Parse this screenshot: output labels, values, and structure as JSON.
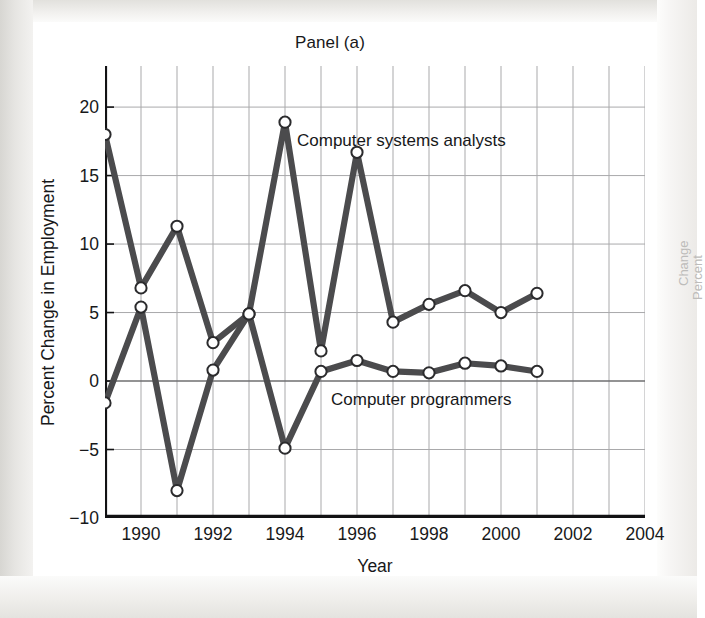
{
  "figure": {
    "title": "Panel (a)",
    "xlabel": "Year",
    "ylabel": "Percent Change in Employment"
  },
  "series_labels": {
    "analysts": "Computer systems analysts",
    "programmers": "Computer programmers"
  },
  "ghost": {
    "line1": "Percent",
    "line2": "Change"
  },
  "colors": {
    "line": "#4b4b4d",
    "marker_fill": "#ffffff",
    "marker_stroke": "#2b2b2d",
    "grid": "#a9a9ab",
    "axis": "#121214",
    "text": "#17181a"
  },
  "chart_data": {
    "type": "line",
    "title": "Panel (a)",
    "xlabel": "Year",
    "ylabel": "Percent Change in Employment",
    "xlim": [
      1989,
      2004
    ],
    "ylim": [
      -10,
      23
    ],
    "ytick_labels": [
      "20",
      "15",
      "10",
      "5",
      "0",
      "-5",
      "-10"
    ],
    "yticks": [
      20,
      15,
      10,
      5,
      0,
      -5,
      -10
    ],
    "xtick_labels": [
      "1990",
      "1992",
      "1994",
      "1996",
      "1998",
      "2000",
      "2002",
      "2004"
    ],
    "xticks": [
      1990,
      1992,
      1994,
      1996,
      1998,
      2000,
      2002,
      2004
    ],
    "grid": true,
    "legend": "inline-labels",
    "x": [
      1989,
      1990,
      1991,
      1992,
      1993,
      1994,
      1995,
      1996,
      1997,
      1998,
      1999,
      2000,
      2001
    ],
    "series": [
      {
        "name": "Computer systems analysts",
        "values": [
          18.0,
          6.8,
          11.3,
          2.8,
          4.9,
          18.9,
          2.2,
          16.7,
          4.3,
          5.6,
          6.6,
          5.0,
          6.4
        ]
      },
      {
        "name": "Computer programmers",
        "values": [
          -1.6,
          5.4,
          -8.0,
          0.8,
          4.9,
          -4.9,
          0.7,
          1.5,
          0.7,
          0.6,
          1.3,
          1.1,
          0.7
        ]
      }
    ]
  }
}
